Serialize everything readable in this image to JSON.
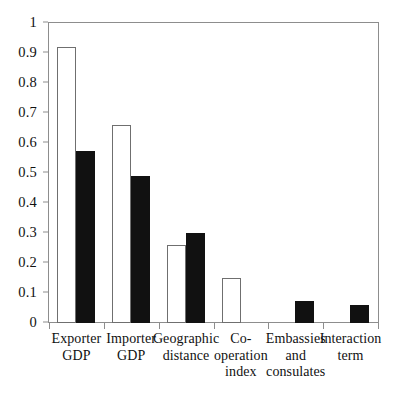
{
  "chart_data": {
    "type": "bar",
    "title": "",
    "subtitle": "",
    "xlabel": "",
    "ylabel": "",
    "ylim": [
      0,
      1
    ],
    "yticks": [
      "0",
      "0.1",
      "0.2",
      "0.3",
      "0.4",
      "0.5",
      "0.6",
      "0.7",
      "0.8",
      "0.9",
      "1"
    ],
    "ytick_values": [
      0,
      0.1,
      0.2,
      0.3,
      0.4,
      0.5,
      0.6,
      0.7,
      0.8,
      0.9,
      1
    ],
    "grid": false,
    "legend": null,
    "legend_position": "none",
    "categories": [
      "Exporter GDP",
      "Importer GDP",
      "Geographic distance",
      "Co-operation index",
      "Embassies and consulates",
      "Interaction term"
    ],
    "category_label_lines": [
      [
        "Exporter",
        "GDP"
      ],
      [
        "Importer",
        "GDP"
      ],
      [
        "Geographic",
        "distance"
      ],
      [
        "Co-",
        "operation",
        "index"
      ],
      [
        "Embassies",
        "and",
        "consulates"
      ],
      [
        "Interaction",
        "term"
      ]
    ],
    "series": [
      {
        "name": "open",
        "style": "white-outlined",
        "color": "#ffffff",
        "edge_color": "#6f6f6f",
        "values": [
          0.92,
          0.66,
          0.26,
          0.15,
          0.0,
          0.0
        ]
      },
      {
        "name": "filled",
        "style": "black-filled",
        "color": "#111111",
        "edge_color": "#111111",
        "values": [
          0.575,
          0.49,
          0.3,
          0.0,
          0.075,
          0.06
        ]
      }
    ]
  },
  "axis": {
    "frame_color": "#8d8d8d",
    "baseline_value": "0"
  }
}
